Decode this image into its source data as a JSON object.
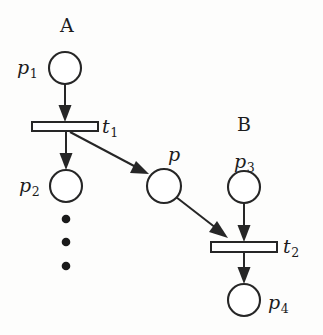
{
  "figure": {
    "kind": "petri-net-diagram",
    "width": 323,
    "height": 335,
    "background_color": "#fdfdfc",
    "ink_color": "#262626"
  },
  "groups": [
    {
      "id": "group-a",
      "label": "A",
      "x": 67,
      "y": 26
    },
    {
      "id": "group-b",
      "label": "B",
      "x": 244,
      "y": 125
    }
  ],
  "places": [
    {
      "id": "p1",
      "label": "p",
      "subscript": "1",
      "cx": 65,
      "cy": 68,
      "r": 16,
      "label_x": 24,
      "label_y": 68
    },
    {
      "id": "p2",
      "label": "p",
      "subscript": "2",
      "cx": 66,
      "cy": 186,
      "r": 16,
      "label_x": 26,
      "label_y": 186
    },
    {
      "id": "p",
      "label": "p",
      "subscript": "",
      "cx": 164,
      "cy": 186,
      "r": 17,
      "label_x": 172,
      "label_y": 155
    },
    {
      "id": "p3",
      "label": "p",
      "subscript": "3",
      "cx": 244,
      "cy": 187,
      "r": 16,
      "label_x": 247,
      "label_y": 162
    },
    {
      "id": "p4",
      "label": "p",
      "subscript": "4",
      "cx": 244,
      "cy": 300,
      "r": 16,
      "label_x": 281,
      "label_y": 304
    }
  ],
  "transitions": [
    {
      "id": "t1",
      "label": "t",
      "subscript": "1",
      "x": 32,
      "y": 122,
      "w": 66,
      "h": 9,
      "label_x": 106,
      "label_y": 128
    },
    {
      "id": "t2",
      "label": "t",
      "subscript": "2",
      "x": 211,
      "y": 242,
      "w": 66,
      "h": 10,
      "label_x": 288,
      "label_y": 248
    }
  ],
  "arcs": [
    {
      "id": "arc-p1-t1",
      "from": "p1",
      "to": "t1",
      "kind": "vertical"
    },
    {
      "id": "arc-t1-p2",
      "from": "t1",
      "to": "p2",
      "kind": "vertical"
    },
    {
      "id": "arc-t1-p",
      "from": "t1",
      "to": "p",
      "kind": "diagonal"
    },
    {
      "id": "arc-p-t2",
      "from": "p",
      "to": "t2",
      "kind": "diagonal"
    },
    {
      "id": "arc-p3-t2",
      "from": "p3",
      "to": "t2",
      "kind": "vertical"
    },
    {
      "id": "arc-t2-p4",
      "from": "t2",
      "to": "p4",
      "kind": "vertical"
    }
  ],
  "ellipsis": {
    "id": "vertical-ellipsis",
    "dots": [
      {
        "cx": 66,
        "cy": 219,
        "r": 4.3
      },
      {
        "cx": 66,
        "cy": 242,
        "r": 4.3
      },
      {
        "cx": 66,
        "cy": 266,
        "r": 4.3
      }
    ]
  }
}
